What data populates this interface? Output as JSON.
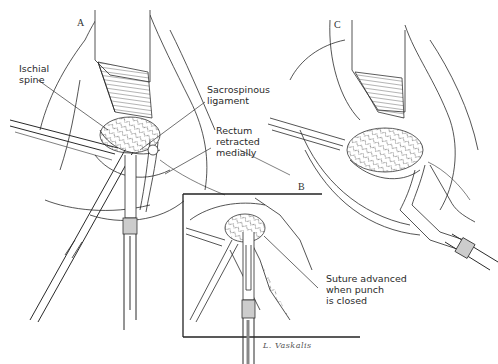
{
  "figure": {
    "panels": [
      {
        "id": "A",
        "label": "A"
      },
      {
        "id": "B",
        "label": "B"
      },
      {
        "id": "C",
        "label": "C"
      }
    ],
    "annotations": {
      "ischial_spine": "Ischial\nspine",
      "sacrospinous_ligament": "Sacrospinous\nligament",
      "rectum": "Rectum\nretracted\nmedially",
      "suture": "Suture advanced\nwhen punch\nis closed"
    },
    "signature": "L. Vaskalis",
    "colors": {
      "line": "#2a2a2a",
      "background": "#ffffff"
    }
  }
}
